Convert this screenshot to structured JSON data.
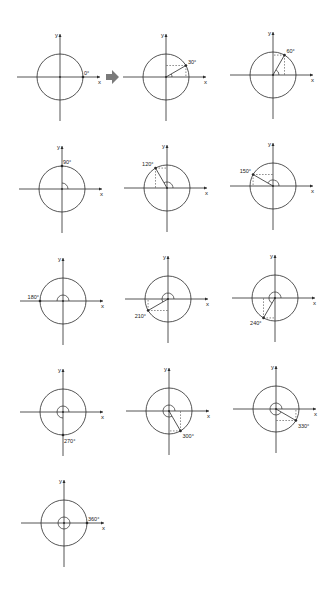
{
  "figure": {
    "axis_labels": {
      "x": "x",
      "y": "y"
    },
    "stroke_color": "#2a2a2a",
    "dashed_color": "#3a3a3a",
    "arrow_color": "#7a7a7a",
    "radius": 23,
    "diagrams": [
      {
        "angle": 0,
        "label": "0°",
        "cx": 60,
        "cy": 77
      },
      {
        "angle": 30,
        "label": "30°",
        "cx": 166,
        "cy": 77
      },
      {
        "angle": 60,
        "label": "60°",
        "cx": 273,
        "cy": 75
      },
      {
        "angle": 90,
        "label": "90°",
        "cx": 62,
        "cy": 189
      },
      {
        "angle": 120,
        "label": "120°",
        "cx": 167,
        "cy": 188
      },
      {
        "angle": 150,
        "label": "150°",
        "cx": 273,
        "cy": 186
      },
      {
        "angle": 180,
        "label": "180°",
        "cx": 63,
        "cy": 301
      },
      {
        "angle": 210,
        "label": "210°",
        "cx": 168,
        "cy": 299
      },
      {
        "angle": 240,
        "label": "240°",
        "cx": 275,
        "cy": 298
      },
      {
        "angle": 270,
        "label": "270°",
        "cx": 63,
        "cy": 412
      },
      {
        "angle": 300,
        "label": "300°",
        "cx": 169,
        "cy": 411
      },
      {
        "angle": 330,
        "label": "330°",
        "cx": 276,
        "cy": 409
      },
      {
        "angle": 360,
        "label": "360°",
        "cx": 64,
        "cy": 523
      }
    ],
    "transition_arrow": {
      "x": 112,
      "y": 77
    }
  }
}
